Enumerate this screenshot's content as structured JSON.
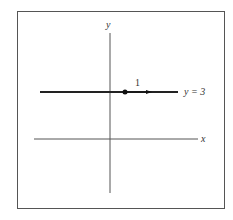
{
  "diagram": {
    "axes": {
      "x_label": "x",
      "y_label": "y"
    },
    "line": {
      "label": "y = 3",
      "equation": "y = 3"
    },
    "vector": {
      "label": "1"
    },
    "colors": {
      "frame": "#555555",
      "axis": "#555555",
      "line": "#222222",
      "point": "#111111",
      "text": "#333333"
    }
  }
}
